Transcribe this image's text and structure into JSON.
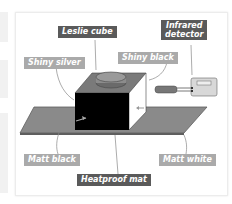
{
  "diagram": {
    "labels": {
      "leslie_cube": "Leslie cube",
      "infrared_detector_line1": "Infrared",
      "infrared_detector_line2": "detector",
      "shiny_silver": "Shiny silver",
      "shiny_black": "Shiny black",
      "matt_black": "Matt black",
      "matt_white": "Matt white",
      "heatproof_mat": "Heatproof mat"
    },
    "colors": {
      "dark_label": "#5a5a5a",
      "light_label": "#aaaaaa",
      "mat": "#8a8a8a",
      "cube_front": "#000000",
      "cube_side": "#ffffff",
      "cube_top": "#7a7a7a",
      "detector_body": "#d8d8d8"
    }
  }
}
